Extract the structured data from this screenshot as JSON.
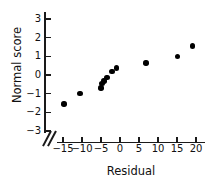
{
  "chart_data": {
    "type": "scatter",
    "title": "",
    "xlabel": "Residual",
    "ylabel": "Normal score",
    "xlim": [
      -17,
      21
    ],
    "ylim": [
      -3.4,
      3.4
    ],
    "xticks": [
      -15,
      -10,
      -5,
      0,
      5,
      10,
      15,
      20
    ],
    "xtick_labels": [
      "−15",
      "−10",
      "−5",
      "0",
      "5",
      "10",
      "15",
      "20"
    ],
    "yticks": [
      3,
      2,
      1,
      0,
      -1,
      -2,
      -3
    ],
    "ytick_labels": [
      "3",
      "2",
      "1",
      "0",
      "−1",
      "−2",
      "−3"
    ],
    "grid": false,
    "legend": null,
    "axis_break": {
      "axis": "x",
      "note": "double-slash break between y-axis and first x tick"
    },
    "marker": {
      "shape": "circle",
      "filled": true,
      "color": "#000000"
    },
    "points": [
      {
        "x": -14.7,
        "y": -1.55
      },
      {
        "x": -10.5,
        "y": -1.0
      },
      {
        "x": -5.0,
        "y": -0.7
      },
      {
        "x": -4.7,
        "y": -0.45
      },
      {
        "x": -4.2,
        "y": -0.32
      },
      {
        "x": -3.4,
        "y": -0.12
      },
      {
        "x": -2.1,
        "y": 0.2
      },
      {
        "x": -0.9,
        "y": 0.37
      },
      {
        "x": 6.8,
        "y": 0.65
      },
      {
        "x": 15.2,
        "y": 1.0
      },
      {
        "x": 19.1,
        "y": 1.55
      }
    ]
  }
}
